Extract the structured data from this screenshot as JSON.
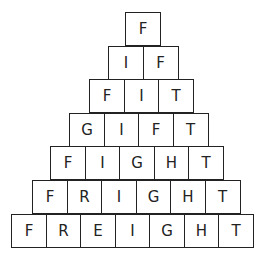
{
  "pyramid": {
    "rows": [
      {
        "word": "F",
        "letters": [
          "F"
        ],
        "left": 125,
        "top": 12
      },
      {
        "word": "IF",
        "letters": [
          "I",
          "F"
        ],
        "left": 108,
        "top": 46
      },
      {
        "word": "FIT",
        "letters": [
          "F",
          "I",
          "T"
        ],
        "left": 89,
        "top": 79
      },
      {
        "word": "GIFT",
        "letters": [
          "G",
          "I",
          "F",
          "T"
        ],
        "left": 69,
        "top": 113
      },
      {
        "word": "FIGHT",
        "letters": [
          "F",
          "I",
          "G",
          "H",
          "T"
        ],
        "left": 50,
        "top": 146
      },
      {
        "word": "FRIGHT",
        "letters": [
          "F",
          "R",
          "I",
          "G",
          "H",
          "T"
        ],
        "left": 32,
        "top": 180
      },
      {
        "word": "FREIGHT",
        "letters": [
          "F",
          "R",
          "E",
          "I",
          "G",
          "H",
          "T"
        ],
        "left": 11,
        "top": 214
      }
    ]
  }
}
